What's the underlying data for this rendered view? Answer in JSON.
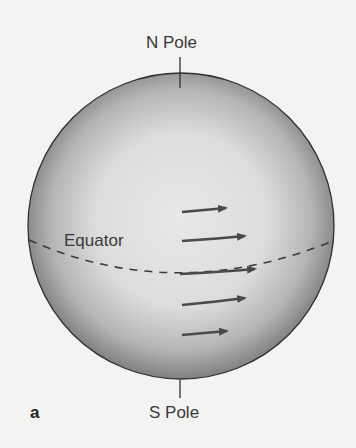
{
  "diagram": {
    "type": "sphere-rotation-diagram",
    "labels": {
      "north_pole": "N Pole",
      "south_pole": "S Pole",
      "equator": "Equator",
      "panel": "a"
    },
    "arrows": {
      "count": 5,
      "direction": "right",
      "lengths_note": "longest at equator, shorter toward poles"
    },
    "colors": {
      "background": "#f3f3f1",
      "sphere_light": "#e6e6e6",
      "sphere_dark": "#8a8a8a",
      "outline": "#2f2f2f",
      "arrow": "#4a4a4a",
      "text": "#3a3a3a"
    }
  }
}
